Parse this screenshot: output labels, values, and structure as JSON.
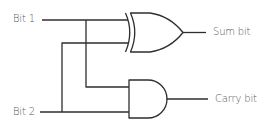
{
  "diagram": {
    "inputs": [
      {
        "id": "bit1",
        "label": "Bit 1"
      },
      {
        "id": "bit2",
        "label": "Bit 2"
      }
    ],
    "gates": [
      {
        "id": "xor",
        "type": "XOR",
        "inputs": [
          "bit1",
          "bit2"
        ],
        "output": "sum"
      },
      {
        "id": "and",
        "type": "AND",
        "inputs": [
          "bit1",
          "bit2"
        ],
        "output": "carry"
      }
    ],
    "outputs": [
      {
        "id": "sum",
        "label": "Sum bit"
      },
      {
        "id": "carry",
        "label": "Carry bit"
      }
    ],
    "colors": {
      "wire": "#2e2e2e",
      "text": "#5a5a5a",
      "background": "#ffffff"
    }
  }
}
